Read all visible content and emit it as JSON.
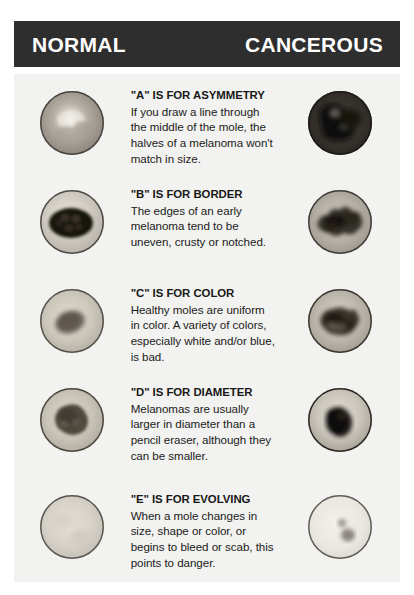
{
  "header": {
    "left_label": "NORMAL",
    "right_label": "CANCEROUS",
    "background_color": "#2e2e2e",
    "text_color": "#ffffff"
  },
  "panel": {
    "background_color": "#f2f2f0"
  },
  "rows": [
    {
      "letter": "A",
      "term": "\"A\" IS FOR ASYMMETRY",
      "description": "If you draw a line through the middle of the mole, the halves of a melanoma won't match in size.",
      "normal_image_name": "normal-mole-asymmetry",
      "cancerous_image_name": "cancerous-mole-asymmetry"
    },
    {
      "letter": "B",
      "term": "\"B\" IS FOR BORDER",
      "description": "The edges of an early melanoma tend to be uneven, crusty or notched.",
      "normal_image_name": "normal-mole-border",
      "cancerous_image_name": "cancerous-mole-border"
    },
    {
      "letter": "C",
      "term": "\"C\" IS FOR COLOR",
      "description": "Healthy moles are uniform in color. A variety of colors, especially white and/or blue, is bad.",
      "normal_image_name": "normal-mole-color",
      "cancerous_image_name": "cancerous-mole-color"
    },
    {
      "letter": "D",
      "term": "\"D\" IS FOR DIAMETER",
      "description": "Melanomas are usually larger in diameter than a pencil eraser, although they can be smaller.",
      "normal_image_name": "normal-mole-diameter",
      "cancerous_image_name": "cancerous-mole-diameter"
    },
    {
      "letter": "E",
      "term": "\"E\" IS FOR EVOLVING",
      "description": "When a mole changes in size, shape or color, or begins to bleed or scab, this points to danger.",
      "normal_image_name": "normal-mole-evolving",
      "cancerous_image_name": "cancerous-mole-evolving"
    }
  ]
}
